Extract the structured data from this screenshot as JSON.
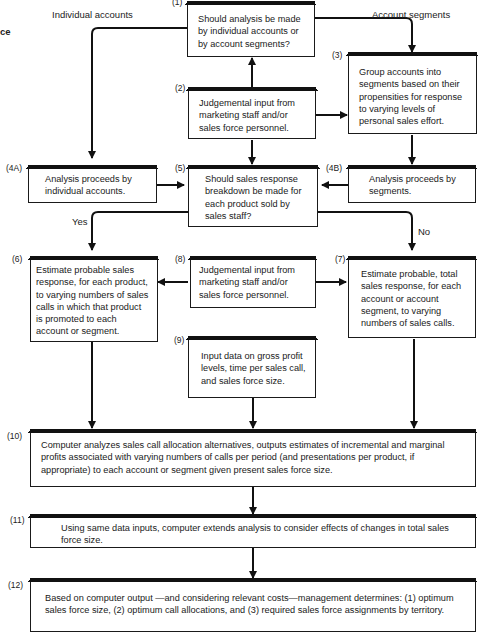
{
  "title_fragment": "ce",
  "branch_labels": {
    "individual": "Individual accounts",
    "segments": "Account segments",
    "yes": "Yes",
    "no": "No"
  },
  "boxes": {
    "b1": {
      "num": "(1)",
      "text": "Should analysis be made by individual accounts or by account segments?"
    },
    "b2": {
      "num": "(2)",
      "text": "Judgemental input from marketing staff and/or sales force personnel."
    },
    "b3": {
      "num": "(3)",
      "text": "Group accounts into segments based on their propensities for response to varying levels of personal sales effort."
    },
    "b4a": {
      "num": "(4A)",
      "text": "Analysis proceeds by individual accounts."
    },
    "b4b": {
      "num": "(4B)",
      "text": "Analysis proceeds by segments."
    },
    "b5": {
      "num": "(5)",
      "text": "Should sales response breakdown be made for each product sold by sales staff?"
    },
    "b6": {
      "num": "(6)",
      "text": "Estimate probable sales response, for each product, to varying numbers of sales calls in which that product is promoted to each account or segment."
    },
    "b7": {
      "num": "(7)",
      "text": "Estimate probable, total sales response, for each account or account segment, to varying numbers of sales calls."
    },
    "b8": {
      "num": "(8)",
      "text": "Judgemental input from marketing staff and/or sales force personnel."
    },
    "b9": {
      "num": "(9)",
      "text": "Input data on gross profit levels, time per sales call, and sales force size."
    },
    "b10": {
      "num": "(10)",
      "text": "Computer analyzes sales call allocation alternatives, outputs estimates of incremental and marginal profits associated with varying numbers of calls per period (and presentations per product, if appropriate) to each account or segment given present sales force size."
    },
    "b11": {
      "num": "(11)",
      "text": "Using same data inputs, computer extends analysis to consider effects of changes in total sales force size."
    },
    "b12": {
      "num": "(12)",
      "text": "Based on computer output —and considering relevant costs—management determines: (1) optimum sales force size, (2) optimum call allocations, and (3) required sales force assignments by territory."
    }
  }
}
